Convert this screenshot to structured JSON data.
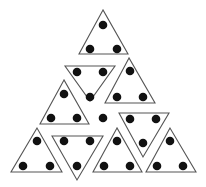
{
  "figure": {
    "colors": {
      "background": "#ffffff",
      "outline": "#555555",
      "dot": "#111111"
    },
    "dot_radius": 4.3,
    "triangles": [
      {
        "id": "t1",
        "orientation": "up",
        "points": [
          [
            103,
            10
          ],
          [
            79,
            54
          ],
          [
            128,
            54
          ]
        ],
        "dots": [
          [
            103,
            25
          ],
          [
            90,
            49
          ],
          [
            117,
            49
          ]
        ]
      },
      {
        "id": "t2",
        "orientation": "down",
        "points": [
          [
            65,
            66
          ],
          [
            115,
            66
          ],
          [
            90,
            101
          ]
        ],
        "dots": [
          [
            77,
            72
          ],
          [
            103,
            72
          ],
          [
            90,
            97
          ]
        ]
      },
      {
        "id": "t3",
        "orientation": "up",
        "points": [
          [
            129,
            58
          ],
          [
            105,
            103
          ],
          [
            155,
            103
          ]
        ],
        "dots": [
          [
            130,
            71
          ],
          [
            117,
            97
          ],
          [
            143,
            97
          ]
        ]
      },
      {
        "id": "t4",
        "orientation": "up",
        "points": [
          [
            64,
            80
          ],
          [
            40,
            124
          ],
          [
            89,
            124
          ]
        ],
        "dots": [
          [
            64,
            94
          ],
          [
            51,
            118
          ],
          [
            77,
            118
          ]
        ]
      },
      {
        "id": "t5",
        "orientation": "down",
        "points": [
          [
            119,
            113
          ],
          [
            169,
            113
          ],
          [
            143,
            157
          ]
        ],
        "dots": [
          [
            130,
            119
          ],
          [
            156,
            119
          ],
          [
            143,
            143
          ]
        ]
      },
      {
        "id": "t6",
        "orientation": "up",
        "points": [
          [
            37,
            128
          ],
          [
            11,
            172
          ],
          [
            62,
            172
          ]
        ],
        "dots": [
          [
            37,
            141
          ],
          [
            23,
            166
          ],
          [
            50,
            166
          ]
        ]
      },
      {
        "id": "t7",
        "orientation": "down",
        "points": [
          [
            52,
            136
          ],
          [
            103,
            136
          ],
          [
            77,
            180
          ]
        ],
        "dots": [
          [
            64,
            141
          ],
          [
            90,
            141
          ],
          [
            77,
            166
          ]
        ]
      },
      {
        "id": "t8",
        "orientation": "up",
        "points": [
          [
            117,
            128
          ],
          [
            93,
            172
          ],
          [
            142,
            172
          ]
        ],
        "dots": [
          [
            117,
            141
          ],
          [
            104,
            166
          ],
          [
            130,
            166
          ]
        ]
      },
      {
        "id": "t9",
        "orientation": "up",
        "points": [
          [
            170,
            128
          ],
          [
            146,
            172
          ],
          [
            196,
            172
          ]
        ],
        "dots": [
          [
            170,
            141
          ],
          [
            157,
            166
          ],
          [
            183,
            166
          ]
        ]
      }
    ],
    "loose_dots": [
      [
        103,
        118
      ]
    ]
  }
}
